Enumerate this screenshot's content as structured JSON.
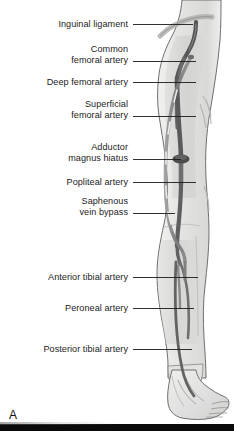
{
  "figure": {
    "panel_letter": "A",
    "labels": [
      {
        "id": "inguinal-ligament",
        "lines": [
          "Inguinal ligament"
        ],
        "text_x": 128,
        "text_y": 19,
        "line_x1": 133,
        "line_x2": 193,
        "line_y": 24,
        "line_y2": 24
      },
      {
        "id": "common-femoral-artery",
        "lines": [
          "Common",
          "femoral artery"
        ],
        "text_x": 128,
        "text_y": 44,
        "line_x1": 133,
        "line_x2": 196,
        "line_y": 61,
        "line_y2": 61
      },
      {
        "id": "deep-femoral-artery",
        "lines": [
          "Deep femoral artery"
        ],
        "text_x": 128,
        "text_y": 77,
        "line_x1": 133,
        "line_x2": 196,
        "line_y": 82,
        "line_y2": 82
      },
      {
        "id": "superficial-femoral-artery",
        "lines": [
          "Superficial",
          "femoral artery"
        ],
        "text_x": 128,
        "text_y": 99,
        "line_x1": 133,
        "line_x2": 196,
        "line_y": 116,
        "line_y2": 116
      },
      {
        "id": "adductor-magnus-hiatus",
        "lines": [
          "Adductor",
          "magnus hiatus"
        ],
        "text_x": 128,
        "text_y": 142,
        "line_x1": 133,
        "line_x2": 181,
        "line_y": 159,
        "line_y2": 159
      },
      {
        "id": "popliteal-artery",
        "lines": [
          "Popliteal artery"
        ],
        "text_x": 128,
        "text_y": 177,
        "line_x1": 133,
        "line_x2": 196,
        "line_y": 182,
        "line_y2": 182
      },
      {
        "id": "saphenous-vein-bypass",
        "lines": [
          "Saphenous",
          "vein bypass"
        ],
        "text_x": 128,
        "text_y": 196,
        "line_x1": 133,
        "line_x2": 175,
        "line_y": 213,
        "line_y2": 213
      },
      {
        "id": "anterior-tibial-artery",
        "lines": [
          "Anterior tibial artery"
        ],
        "text_x": 128,
        "text_y": 272,
        "line_x1": 133,
        "line_x2": 198,
        "line_y": 277,
        "line_y2": 277
      },
      {
        "id": "peroneal-artery",
        "lines": [
          "Peroneal artery"
        ],
        "text_x": 128,
        "text_y": 303,
        "line_x1": 133,
        "line_x2": 194,
        "line_y": 308,
        "line_y2": 308
      },
      {
        "id": "posterior-tibial-artery",
        "lines": [
          "Posterior tibial artery"
        ],
        "text_x": 128,
        "text_y": 344,
        "line_x1": 133,
        "line_x2": 192,
        "line_y": 349,
        "line_y2": 349
      }
    ],
    "colors": {
      "background": "#ffffff",
      "limb_fill": "#e6e6e4",
      "limb_outline": "#6f6f6f",
      "muscle_shadow": "#d2d2d0",
      "artery_dark": "#555555",
      "artery_mid": "#7d7d7d",
      "bypass_graft": "#8e8e8e",
      "graft_highlight": "#f2f2f2",
      "hiatus_marker": "#4a4a4a",
      "leader_line": "#1c1c1c",
      "label_text": "#1c1c1c",
      "bottom_bar": "#0a0a0a"
    }
  }
}
